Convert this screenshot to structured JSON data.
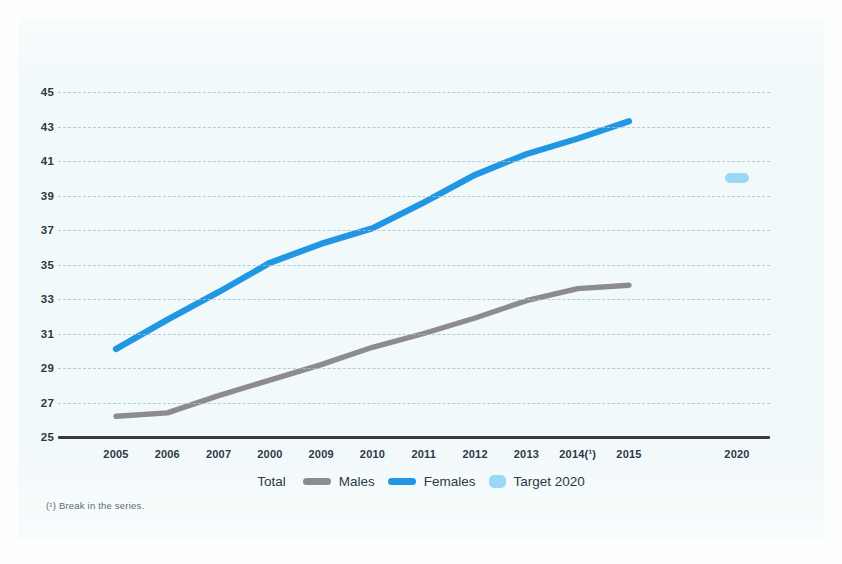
{
  "colors": {
    "background": "#f2f9fb",
    "page": "#fdfefe",
    "females_line": "#2196e3",
    "males_line": "#8c8c8c",
    "target_marker": "#9ad8f5",
    "axis": "#3a3a3a",
    "gridline": "#a9c3d2",
    "text": "#2b3a45",
    "footnote_text": "#5b6b78"
  },
  "legend": {
    "title": "Total",
    "items": [
      {
        "label": "Males",
        "color": "#8c8c8c",
        "shape": "line"
      },
      {
        "label": "Females",
        "color": "#2196e3",
        "shape": "line"
      },
      {
        "label": "Target 2020",
        "color": "#9ad8f5",
        "shape": "dot"
      }
    ]
  },
  "footnote": "(¹) Break in the series.",
  "chart_data": {
    "type": "line",
    "title": "",
    "subtitle": "",
    "xlabel": "",
    "ylabel": "",
    "grid": true,
    "legend_position": "bottom",
    "categories": [
      "2005",
      "2006",
      "2007",
      "2000",
      "2009",
      "2010",
      "2011",
      "2012",
      "2013",
      "2014(¹)",
      "2015",
      "2020"
    ],
    "x_tick_labels": [
      "2005",
      "2006",
      "2007",
      "2000",
      "2009",
      "2010",
      "2011",
      "2012",
      "2013",
      "2014(¹)",
      "2015",
      "2020"
    ],
    "y_tick_labels": [
      "45",
      "43",
      "41",
      "39",
      "37",
      "35",
      "33",
      "31",
      "29",
      "27",
      "25"
    ],
    "y_ticks": [
      45,
      43,
      41,
      39,
      37,
      35,
      33,
      31,
      29,
      27,
      25
    ],
    "ylim": [
      25,
      45
    ],
    "series": [
      {
        "name": "Females",
        "color": "#2196e3",
        "x": [
          "2005",
          "2006",
          "2007",
          "2000",
          "2009",
          "2010",
          "2011",
          "2012",
          "2013",
          "2014(¹)",
          "2015"
        ],
        "values": [
          30.1,
          31.8,
          33.4,
          35.1,
          36.2,
          37.1,
          38.6,
          40.2,
          41.4,
          42.3,
          43.3
        ]
      },
      {
        "name": "Males",
        "color": "#8c8c8c",
        "x": [
          "2005",
          "2006",
          "2007",
          "2000",
          "2009",
          "2010",
          "2011",
          "2012",
          "2013",
          "2014(¹)",
          "2015"
        ],
        "values": [
          26.2,
          26.4,
          27.4,
          28.3,
          29.2,
          30.2,
          31.0,
          31.9,
          32.9,
          33.6,
          33.8
        ]
      },
      {
        "name": "Target 2020",
        "color": "#9ad8f5",
        "type": "marker",
        "x": [
          "2020"
        ],
        "values": [
          40.0
        ]
      }
    ]
  }
}
